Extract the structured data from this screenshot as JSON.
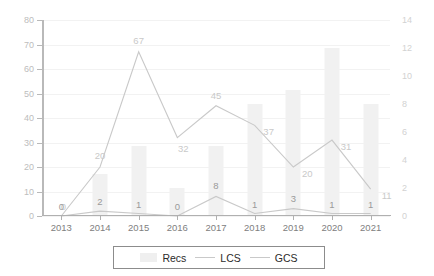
{
  "chart_data": {
    "type": "bar",
    "title": "",
    "xlabel": "",
    "ylabel": "",
    "ylabel_right": "",
    "grid": true,
    "legend_position": "bottom",
    "categories": [
      "2013",
      "2014",
      "2015",
      "2016",
      "2017",
      "2018",
      "2019",
      "2020",
      "2021"
    ],
    "axis_left": {
      "min": 0,
      "max": 80,
      "ticks": [
        "0",
        "10",
        "20",
        "30",
        "40",
        "50",
        "60",
        "70",
        "80"
      ],
      "tick_values": [
        0,
        10,
        20,
        30,
        40,
        50,
        60,
        70,
        80
      ]
    },
    "axis_right": {
      "min": 0,
      "max": 14,
      "ticks": [
        "0",
        "2",
        "4",
        "6",
        "8",
        "10",
        "12",
        "14"
      ],
      "tick_values": [
        0,
        2,
        4,
        6,
        8,
        10,
        12,
        14
      ]
    },
    "series": [
      {
        "name": "Recs",
        "kind": "bar",
        "axis": "right",
        "values": [
          0,
          3,
          5,
          2,
          5,
          8,
          9,
          12,
          8
        ],
        "labels": [
          "",
          "",
          "",
          "",
          "",
          "",
          "",
          "",
          ""
        ]
      },
      {
        "name": "LCS",
        "kind": "line",
        "axis": "left",
        "values": [
          0,
          2,
          1,
          0,
          8,
          1,
          3,
          1,
          1
        ],
        "labels": [
          "0",
          "2",
          "1",
          "0",
          "8",
          "1",
          "3",
          "1",
          "1"
        ]
      },
      {
        "name": "GCS",
        "kind": "line",
        "axis": "left",
        "values": [
          0,
          20,
          67,
          32,
          45,
          37,
          20,
          31,
          11
        ],
        "labels": [
          "0",
          "20",
          "67",
          "32",
          "45",
          "37",
          "20",
          "31",
          "11"
        ]
      }
    ],
    "colors": {
      "bar": "#f1f1f1",
      "lcs_line": "#c9c9c9",
      "gcs_line": "#c9c9c9",
      "grid": "#f2f2f2",
      "axis": "#b9b9b9",
      "tick_text_left": "#bdbdbd",
      "tick_text_right": "#d2d2d2",
      "x_text": "#808080",
      "legend_border": "#8c8c8c",
      "legend_text": "#2b2b2b",
      "background": "#ffffff"
    }
  },
  "legend": {
    "items": [
      {
        "label": "Recs",
        "marker": "bar-swatch"
      },
      {
        "label": "LCS",
        "marker": "line-swatch"
      },
      {
        "label": "GCS",
        "marker": "line-swatch"
      }
    ]
  }
}
